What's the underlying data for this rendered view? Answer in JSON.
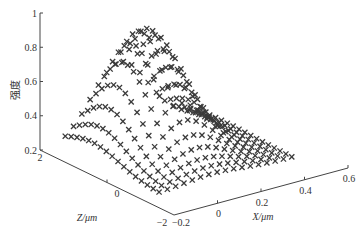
{
  "chart_data": {
    "type": "scatter3d",
    "title": "",
    "xlabel": "X/μm",
    "zlabel": "Z/μm",
    "ylabel": "强度",
    "marker": "x",
    "marker_color": "#3a3a3a",
    "axes": {
      "x": {
        "range": [
          -0.2,
          0.6
        ],
        "ticks": [
          -0.2,
          0,
          0.2,
          0.4,
          0.6
        ],
        "tick_labels": [
          "−0.2",
          "0",
          "0.2",
          "0.4",
          "0.6"
        ]
      },
      "z": {
        "range": [
          -2,
          2
        ],
        "ticks": [
          -2,
          0,
          2
        ],
        "tick_labels": [
          "−2",
          "0",
          "2"
        ]
      },
      "intensity": {
        "range": [
          0.2,
          1
        ],
        "ticks": [
          0.2,
          0.4,
          0.6,
          0.8,
          1
        ],
        "tick_labels": [
          "0.2",
          "0.4",
          "0.6",
          "0.8",
          "1"
        ]
      }
    },
    "grid": false,
    "surface_model": {
      "description": "Gaussian-like intensity distribution sampled on a regular X-Z grid",
      "x_samples": {
        "start": -0.13,
        "end": 0.48,
        "count": 17
      },
      "z_samples": {
        "start": 1.7,
        "end": -1.1,
        "count": 17
      },
      "baseline": 0.22,
      "amplitude": 0.68,
      "center_x": 0.12,
      "center_z": 0.9,
      "sigma_x": 0.13,
      "sigma_z": 0.8,
      "peak_intensity": 0.9
    }
  }
}
